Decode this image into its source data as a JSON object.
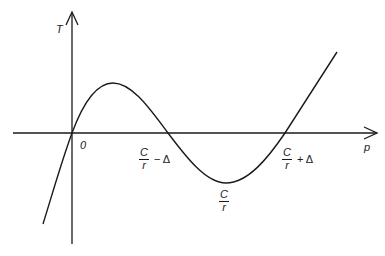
{
  "diagram": {
    "axes": {
      "y_label": "T",
      "x_label": "p",
      "origin_label": "0"
    },
    "curve": {
      "description": "cubic-like curve through origin with maximum then minimum",
      "points": [
        [
          43,
          224
        ],
        [
          72,
          133
        ],
        [
          113,
          83
        ],
        [
          168,
          133
        ],
        [
          226,
          183
        ],
        [
          285,
          133
        ],
        [
          337,
          52
        ]
      ]
    },
    "x_intercepts": [
      {
        "num": "C",
        "den": "r",
        "op": "− Δ"
      },
      {
        "num": "C",
        "den": "r",
        "op": "+ Δ"
      }
    ],
    "minimum_label": {
      "num": "C",
      "den": "r"
    },
    "colors": {
      "line": "#1a1a1a",
      "background": "#ffffff"
    }
  }
}
